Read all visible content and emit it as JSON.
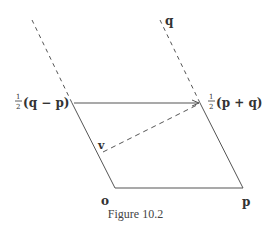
{
  "figure": {
    "caption": "Figure 10.2",
    "colors": {
      "line": "#555555",
      "text": "#333333",
      "background": "#ffffff"
    },
    "points": {
      "o": {
        "label": "o",
        "x": 115,
        "y": 188
      },
      "p": {
        "label": "p",
        "x": 243,
        "y": 188
      },
      "half_q_minus_p": {
        "label_frac": "1/2",
        "label_expr": "(q − p)",
        "x": 72,
        "y": 103
      },
      "half_p_plus_q": {
        "label_frac": "1/2",
        "label_expr": "(p + q)",
        "x": 200,
        "y": 103
      },
      "q": {
        "label": "q",
        "x": 160,
        "y": 20
      },
      "v": {
        "label": "v",
        "x": 102,
        "y": 152
      }
    },
    "labels": {
      "q": "q",
      "v": "v",
      "o": "o",
      "p": "p",
      "half_num": "1",
      "half_den": "2",
      "left_expr": "(q − p)",
      "right_expr": "(p + q)"
    }
  }
}
